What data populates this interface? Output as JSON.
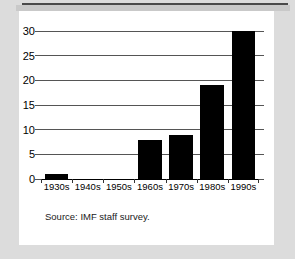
{
  "figure": {
    "source_note": "Source:  IMF staff survey.",
    "background_color": "#dcdcdc",
    "panel_color": "#ffffff",
    "bar_color": "#000000",
    "gridline_color": "#555555"
  },
  "chart_data": {
    "type": "bar",
    "title": "",
    "subtitle": "",
    "xlabel": "",
    "ylabel": "",
    "categories": [
      "1930s",
      "1940s",
      "1950s",
      "1960s",
      "1970s",
      "1980s",
      "1990s"
    ],
    "values": [
      1,
      0,
      0,
      8,
      9,
      19,
      30
    ],
    "series": [
      {
        "name": "",
        "values": [
          1,
          0,
          0,
          8,
          9,
          19,
          30
        ]
      }
    ],
    "ylim": [
      0,
      30
    ],
    "yticks": [
      0,
      5,
      10,
      15,
      20,
      25,
      30
    ],
    "ytick_labels": [
      "0",
      "5",
      "10",
      "15",
      "20",
      "25",
      "30"
    ],
    "grid": true,
    "legend": false,
    "legend_position": "none",
    "annotations": [
      "Source:  IMF staff survey."
    ]
  }
}
